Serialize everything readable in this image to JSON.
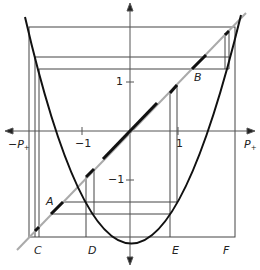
{
  "diagram": {
    "axes": {
      "x_label_left": "−P",
      "x_label_right": "P",
      "subscript": "+",
      "ticks": {
        "x_neg": "−1",
        "x_pos": "1",
        "y_pos": "1",
        "y_neg": "−1"
      }
    },
    "points": {
      "A": "A",
      "B": "B",
      "C": "C",
      "D": "D",
      "E": "E",
      "F": "F"
    },
    "colors": {
      "curve": "#111111",
      "diagonal": "#aaaaaa",
      "diagonal_highlight": "#111111",
      "frame": "#444444"
    }
  }
}
